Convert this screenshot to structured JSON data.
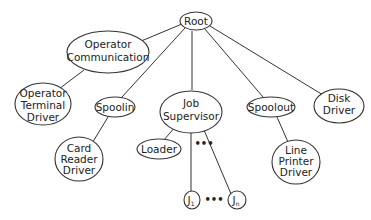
{
  "diagram": {
    "type": "tree",
    "nodes": [
      {
        "id": "root",
        "lines": [
          "Root"
        ]
      },
      {
        "id": "opcomm",
        "lines": [
          "Operator",
          "Communication"
        ]
      },
      {
        "id": "opterm",
        "lines": [
          "Operator",
          "Terminal",
          "Driver"
        ]
      },
      {
        "id": "spoolin",
        "lines": [
          "Spoolin"
        ]
      },
      {
        "id": "cardreader",
        "lines": [
          "Card",
          "Reader",
          "Driver"
        ]
      },
      {
        "id": "jobsup",
        "lines": [
          "Job",
          "Supervisor"
        ]
      },
      {
        "id": "loader",
        "lines": [
          "Loader"
        ]
      },
      {
        "id": "j1",
        "label": "J",
        "sub": "1"
      },
      {
        "id": "jn",
        "label": "J",
        "sub": "n"
      },
      {
        "id": "spoolout",
        "lines": [
          "Spoolout"
        ]
      },
      {
        "id": "lineprinter",
        "lines": [
          "Line",
          "Printer",
          "Driver"
        ]
      },
      {
        "id": "disk",
        "lines": [
          "Disk",
          "Driver"
        ]
      }
    ],
    "edges": [
      [
        "root",
        "opcomm"
      ],
      [
        "root",
        "spoolin"
      ],
      [
        "root",
        "jobsup"
      ],
      [
        "root",
        "spoolout"
      ],
      [
        "root",
        "disk"
      ],
      [
        "opcomm",
        "opterm"
      ],
      [
        "spoolin",
        "cardreader"
      ],
      [
        "jobsup",
        "loader"
      ],
      [
        "jobsup",
        "j1"
      ],
      [
        "jobsup",
        "jn"
      ],
      [
        "spoolout",
        "lineprinter"
      ]
    ],
    "ellipsis": "•••"
  }
}
